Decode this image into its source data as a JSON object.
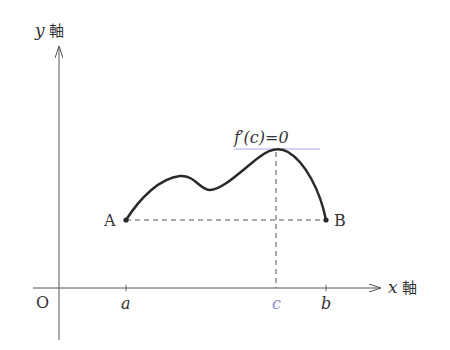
{
  "diagram": {
    "y_axis_label": {
      "var": "y",
      "suffix": "軸"
    },
    "x_axis_label": {
      "var": "x",
      "suffix": "軸"
    },
    "origin_label": "O",
    "x_ticks": [
      {
        "label": "a",
        "color": "#333333"
      },
      {
        "label": "c",
        "color": "#8888cc"
      },
      {
        "label": "b",
        "color": "#333333"
      }
    ],
    "point_a_label": "A",
    "point_b_label": "B",
    "tangent_annotation": "f′(c)=0",
    "colors": {
      "axis": "#555555",
      "curve": "#2a2a2a",
      "tangent_line": "#a9a9e8",
      "dashed": "#555555",
      "c_label": "#8888cc"
    }
  }
}
